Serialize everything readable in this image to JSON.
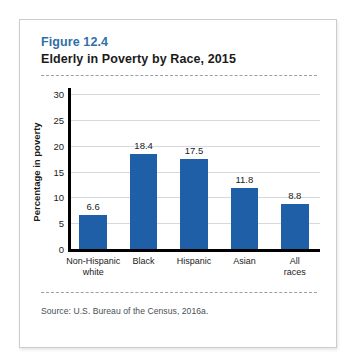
{
  "card": {
    "figure_label": "Figure 12.4",
    "figure_title": "Elderly in Poverty by Race, 2015",
    "source": "Source: U.S. Bureau of the Census, 2016a.",
    "accent_color": "#2f6fa8",
    "bar_color": "#1f5fa8"
  },
  "chart_data": {
    "type": "bar",
    "title": "Elderly in Poverty by Race, 2015",
    "subtitle": "Figure 12.4",
    "categories": [
      "Non-Hispanic\nwhite",
      "Black",
      "Hispanic",
      "Asian",
      "All races"
    ],
    "values": [
      6.6,
      18.4,
      17.5,
      11.8,
      8.8
    ],
    "value_labels": [
      "6.6",
      "18.4",
      "17.5",
      "11.8",
      "8.8"
    ],
    "xlabel": "",
    "ylabel": "Percentage in poverty",
    "ylim": [
      0,
      30
    ],
    "yticks": [
      0,
      5,
      10,
      15,
      20,
      25,
      30
    ],
    "ytick_labels": [
      "0",
      "5",
      "10",
      "15",
      "20",
      "25",
      "30"
    ],
    "grid": "horizontal",
    "legend": "none",
    "source": "Source: U.S. Bureau of the Census, 2016a."
  }
}
